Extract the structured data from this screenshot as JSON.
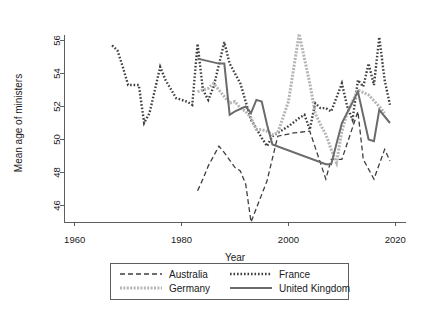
{
  "chart_data": {
    "type": "line",
    "title": "",
    "xlabel": "Year",
    "ylabel": "Mean age of ministers",
    "xlim": [
      1958,
      2022
    ],
    "ylim": [
      45,
      57
    ],
    "xticks": [
      1960,
      1980,
      2000,
      2020
    ],
    "xtick_labels": [
      "1960",
      "1980",
      "2000",
      "2020"
    ],
    "yticks": [
      46,
      48,
      50,
      52,
      54,
      56
    ],
    "ytick_labels": [
      "46",
      "48",
      "50",
      "52",
      "54",
      "56"
    ],
    "grid": false,
    "legend_position": "below-axes",
    "series": [
      {
        "name": "Australia",
        "style": "dashed",
        "color": "#3f3f3f",
        "width": 1.3,
        "dash": "5,3",
        "points": [
          [
            1983,
            46.9
          ],
          [
            1984,
            47.6
          ],
          [
            1985,
            48.4
          ],
          [
            1987,
            49.6
          ],
          [
            1988,
            49.2
          ],
          [
            1990,
            48.3
          ],
          [
            1991,
            48.1
          ],
          [
            1992,
            47.3
          ],
          [
            1993,
            45.0
          ],
          [
            1996,
            47.5
          ],
          [
            1998,
            50.2
          ],
          [
            2001,
            50.4
          ],
          [
            2004,
            50.5
          ],
          [
            2007,
            47.6
          ],
          [
            2008,
            48.8
          ],
          [
            2010,
            48.8
          ],
          [
            2013,
            51.7
          ],
          [
            2014,
            48.8
          ],
          [
            2016,
            47.6
          ],
          [
            2018,
            49.4
          ],
          [
            2019,
            48.7
          ]
        ]
      },
      {
        "name": "France",
        "style": "dotted",
        "color": "#3f3f3f",
        "width": 2.4,
        "dash": "1.6,1.9",
        "points": [
          [
            1967,
            55.7
          ],
          [
            1968,
            55.4
          ],
          [
            1969,
            54.4
          ],
          [
            1970,
            53.3
          ],
          [
            1971,
            53.3
          ],
          [
            1972,
            53.3
          ],
          [
            1973,
            51.0
          ],
          [
            1974,
            51.6
          ],
          [
            1976,
            54.4
          ],
          [
            1977,
            53.6
          ],
          [
            1979,
            52.5
          ],
          [
            1981,
            52.3
          ],
          [
            1982,
            52.1
          ],
          [
            1983,
            55.8
          ],
          [
            1984,
            53.0
          ],
          [
            1985,
            52.4
          ],
          [
            1986,
            53.2
          ],
          [
            1988,
            55.9
          ],
          [
            1989,
            54.6
          ],
          [
            1991,
            53.4
          ],
          [
            1992,
            52.3
          ],
          [
            1993,
            51.2
          ],
          [
            1995,
            50.1
          ],
          [
            1996,
            49.6
          ],
          [
            1997,
            50.2
          ],
          [
            1999,
            50.6
          ],
          [
            2000,
            50.8
          ],
          [
            2002,
            51.3
          ],
          [
            2003,
            51.5
          ],
          [
            2004,
            50.6
          ],
          [
            2005,
            52.2
          ],
          [
            2006,
            51.9
          ],
          [
            2007,
            51.9
          ],
          [
            2008,
            51.7
          ],
          [
            2010,
            53.4
          ],
          [
            2011,
            52.0
          ],
          [
            2012,
            51.2
          ],
          [
            2013,
            53.6
          ],
          [
            2014,
            53.2
          ],
          [
            2015,
            54.6
          ],
          [
            2016,
            53.3
          ],
          [
            2017,
            56.2
          ],
          [
            2018,
            53.6
          ],
          [
            2019,
            52.1
          ]
        ]
      },
      {
        "name": "Germany",
        "style": "light-dotted",
        "color": "#b5b5b5",
        "width": 3.0,
        "dash": "2,1.4",
        "points": [
          [
            1983,
            52.9
          ],
          [
            1985,
            53.1
          ],
          [
            1986,
            53.4
          ],
          [
            1987,
            53.0
          ],
          [
            1989,
            52.2
          ],
          [
            1990,
            52.3
          ],
          [
            1991,
            51.9
          ],
          [
            1992,
            51.7
          ],
          [
            1993,
            51.3
          ],
          [
            1994,
            50.6
          ],
          [
            1995,
            50.6
          ],
          [
            1996,
            50.5
          ],
          [
            1997,
            50.3
          ],
          [
            1998,
            50.4
          ],
          [
            2000,
            52.3
          ],
          [
            2002,
            56.4
          ],
          [
            2004,
            53.4
          ],
          [
            2005,
            51.6
          ],
          [
            2006,
            50.9
          ],
          [
            2007,
            50.3
          ],
          [
            2008,
            49.4
          ],
          [
            2009,
            48.6
          ],
          [
            2010,
            50.5
          ],
          [
            2011,
            51.6
          ],
          [
            2013,
            53.0
          ],
          [
            2015,
            52.7
          ],
          [
            2017,
            52.0
          ],
          [
            2018,
            51.6
          ]
        ]
      },
      {
        "name": "United Kingdom",
        "style": "solid",
        "color": "#6b6b6b",
        "width": 2.0,
        "dash": "",
        "points": [
          [
            1983,
            54.9
          ],
          [
            1987,
            54.6
          ],
          [
            1988,
            54.6
          ],
          [
            1989,
            51.5
          ],
          [
            1990,
            51.7
          ],
          [
            1992,
            52.0
          ],
          [
            1993,
            51.6
          ],
          [
            1994,
            52.4
          ],
          [
            1995,
            52.3
          ],
          [
            1996,
            50.9
          ],
          [
            1997,
            49.7
          ],
          [
            2007,
            48.5
          ],
          [
            2008,
            48.5
          ],
          [
            2010,
            51.0
          ],
          [
            2013,
            52.9
          ],
          [
            2015,
            50.0
          ],
          [
            2016,
            49.9
          ],
          [
            2017,
            51.8
          ],
          [
            2019,
            51.0
          ]
        ]
      }
    ],
    "legend_entries": [
      {
        "label": "Australia",
        "style": "dashed",
        "color": "#3f3f3f"
      },
      {
        "label": "France",
        "style": "dotted",
        "color": "#3f3f3f"
      },
      {
        "label": "Germany",
        "style": "light-dotted",
        "color": "#b5b5b5"
      },
      {
        "label": "United Kingdom",
        "style": "solid",
        "color": "#6b6b6b"
      }
    ]
  }
}
